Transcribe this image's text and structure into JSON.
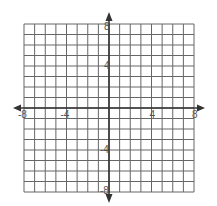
{
  "figure": {
    "type": "coordinate-plane",
    "x_range": [
      -8,
      8
    ],
    "y_range": [
      -8,
      8
    ],
    "grid_step": 1,
    "grid_color": "#666666",
    "axis_color": "#333333",
    "x_tick_labels": [
      {
        "value": -8,
        "text": "-8"
      },
      {
        "value": -4,
        "text": "-4"
      },
      {
        "value": 4,
        "text": "4"
      },
      {
        "value": 8,
        "text": "8"
      }
    ],
    "y_tick_labels": [
      {
        "value": 8,
        "text": "8"
      },
      {
        "value": 4,
        "text": "4"
      },
      {
        "value": -4,
        "text": "-4"
      },
      {
        "value": -8,
        "text": "-8"
      }
    ]
  }
}
